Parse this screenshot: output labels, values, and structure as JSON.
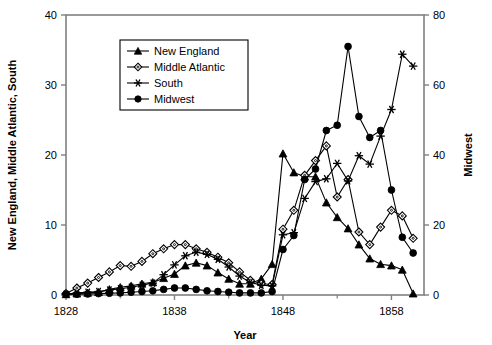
{
  "chart_data": {
    "type": "line",
    "title": "",
    "xlabel": "Year",
    "ylabel": "New England, Middle Atlantic, South",
    "y2label": "Midwest",
    "xlim": [
      1828,
      1861
    ],
    "ylim": [
      0,
      40
    ],
    "y2lim": [
      0,
      80
    ],
    "xticks": [
      1828,
      1838,
      1848,
      1858
    ],
    "xtick_labels": [
      "1828",
      "1838",
      "1848",
      "1858"
    ],
    "xminor_ticks": [
      1833,
      1843,
      1853
    ],
    "yticks": [
      0,
      10,
      20,
      30,
      40
    ],
    "ytick_labels": [
      "0",
      "10",
      "20",
      "30",
      "40"
    ],
    "y2ticks": [
      0,
      20,
      40,
      60,
      80
    ],
    "y2tick_labels": [
      "0",
      "20",
      "40",
      "60",
      "80"
    ],
    "grid": false,
    "legend_position": "upper-left-inside",
    "x": [
      1828,
      1829,
      1830,
      1831,
      1832,
      1833,
      1834,
      1835,
      1836,
      1837,
      1838,
      1839,
      1840,
      1841,
      1842,
      1843,
      1844,
      1845,
      1846,
      1847,
      1848,
      1849,
      1850,
      1851,
      1852,
      1853,
      1854,
      1855,
      1856,
      1857,
      1858,
      1859,
      1860
    ],
    "series": [
      {
        "name": "New England",
        "axis": "left",
        "marker": "filled-triangle",
        "values": [
          0.1,
          0.2,
          0.3,
          0.4,
          0.8,
          1.1,
          1.3,
          1.6,
          1.8,
          2.4,
          3.0,
          4.2,
          4.6,
          4.2,
          3.2,
          2.3,
          1.6,
          1.6,
          2.3,
          4.4,
          7.6,
          11.0,
          14.9,
          18.1,
          20.2,
          17.5,
          16.8,
          16.9,
          13.9,
          10.5,
          7.5,
          7.1,
          5.6
        ]
      },
      {
        "name": "Middle Atlantic",
        "axis": "left",
        "marker": "open-diamond",
        "values": [
          0.2,
          1.0,
          1.7,
          2.5,
          3.3,
          4.2,
          4.1,
          4.8,
          5.9,
          6.6,
          7.2,
          7.2,
          6.6,
          6.1,
          5.4,
          4.6,
          3.3,
          2.1,
          1.6,
          1.5,
          1.8,
          3.4,
          5.9,
          8.5,
          9.8,
          12.0,
          14.3,
          16.2,
          18.0,
          21.2,
          18.0,
          14.2,
          11.4
        ]
      },
      {
        "name": "South",
        "axis": "left",
        "marker": "asterisk",
        "values": [
          0.1,
          0.3,
          0.4,
          0.5,
          0.7,
          0.9,
          1.1,
          1.4,
          1.7,
          2.9,
          4.3,
          5.6,
          6.1,
          5.8,
          5.1,
          4.0,
          2.7,
          1.8,
          1.4,
          1.3,
          1.4,
          1.9,
          2.6,
          3.3,
          4.2,
          5.6,
          7.1,
          8.6,
          8.3,
          7.0,
          5.5,
          4.3,
          3.0
        ]
      },
      {
        "name": "Midwest",
        "axis": "right",
        "marker": "filled-circle",
        "values_right": [
          0.2,
          0.2,
          0.3,
          0.4,
          0.5,
          0.6,
          0.8,
          1.0,
          1.2,
          1.6,
          2.0,
          2.0,
          1.6,
          1.2,
          1.0,
          0.8,
          0.6,
          0.6,
          0.6,
          1.0,
          1.6,
          2.2,
          3.2,
          4.6,
          6.2,
          8.0,
          9.6,
          9.8,
          9.6,
          9.6,
          9.2,
          9.2,
          8.8
        ]
      }
    ],
    "note_series_overrides": {
      "NewEngland_late": [
        [
          1848,
          20.2
        ],
        [
          1849,
          17.5
        ],
        [
          1850,
          16.9
        ],
        [
          1851,
          16.9
        ],
        [
          1852,
          13.2
        ],
        [
          1853,
          11.1
        ],
        [
          1854,
          9.5
        ],
        [
          1855,
          7.2
        ],
        [
          1856,
          5.2
        ],
        [
          1857,
          4.4
        ],
        [
          1858,
          4.2
        ],
        [
          1859,
          3.6
        ],
        [
          1860,
          0.2
        ]
      ],
      "MiddleAtlantic_late": [
        [
          1848,
          9.4
        ],
        [
          1849,
          12.1
        ],
        [
          1850,
          17.1
        ],
        [
          1851,
          19.2
        ],
        [
          1852,
          21.3
        ],
        [
          1853,
          14.0
        ],
        [
          1854,
          16.5
        ],
        [
          1855,
          9.0
        ],
        [
          1856,
          7.2
        ],
        [
          1857,
          9.7
        ],
        [
          1858,
          12.1
        ],
        [
          1859,
          11.3
        ],
        [
          1860,
          8.1
        ]
      ],
      "South_late": [
        [
          1848,
          8.6
        ],
        [
          1849,
          8.9
        ],
        [
          1850,
          13.8
        ],
        [
          1851,
          16.2
        ],
        [
          1852,
          16.6
        ],
        [
          1853,
          18.8
        ],
        [
          1854,
          16.3
        ],
        [
          1855,
          19.9
        ],
        [
          1856,
          18.7
        ],
        [
          1857,
          22.7
        ],
        [
          1858,
          26.5
        ],
        [
          1859,
          34.4
        ],
        [
          1860,
          32.7
        ]
      ],
      "Midwest_right_late": [
        [
          1848,
          13.0
        ],
        [
          1849,
          17.0
        ],
        [
          1850,
          33.0
        ],
        [
          1851,
          36.0
        ],
        [
          1852,
          47.0
        ],
        [
          1853,
          48.5
        ],
        [
          1854,
          71.0
        ],
        [
          1855,
          51.0
        ],
        [
          1856,
          45.0
        ],
        [
          1857,
          47.0
        ],
        [
          1858,
          30.0
        ],
        [
          1859,
          16.5
        ],
        [
          1860,
          12.0
        ]
      ]
    }
  },
  "labels": {
    "xlabel": "Year",
    "ylabel": "New England, Middle Atlantic, South",
    "y2label": "Midwest"
  },
  "legend": {
    "items": [
      {
        "label": "New England",
        "marker": "filled-triangle"
      },
      {
        "label": "Middle Atlantic",
        "marker": "open-diamond"
      },
      {
        "label": "South",
        "marker": "asterisk"
      },
      {
        "label": "Midwest",
        "marker": "filled-circle"
      }
    ]
  },
  "colors": {
    "line": "#000000",
    "axis": "#808080",
    "background": "#ffffff"
  }
}
